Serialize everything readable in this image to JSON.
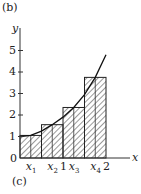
{
  "labels": {
    "top": "(b)",
    "bottom": "(c)",
    "xaxis": "x",
    "yaxis": "y",
    "origin": "0"
  },
  "chart_data": {
    "type": "bar",
    "title": "",
    "xlabel": "x",
    "ylabel": "y",
    "categories": [
      "x1",
      "x2",
      "x3",
      "x4"
    ],
    "intervals": [
      [
        0,
        0.5
      ],
      [
        0.5,
        1
      ],
      [
        1,
        1.5
      ],
      [
        1.5,
        2
      ]
    ],
    "values": [
      1.05,
      1.55,
      2.35,
      3.75
    ],
    "curve": {
      "x": [
        0,
        0.25,
        0.5,
        0.75,
        1,
        1.25,
        1.5,
        1.75,
        2
      ],
      "y": [
        1,
        1.05,
        1.25,
        1.55,
        1.9,
        2.35,
        2.95,
        3.75,
        4.8
      ]
    },
    "yticks": [
      "1",
      "2",
      "3",
      "4",
      "5"
    ],
    "xticks": [
      "x1",
      "x2",
      "1",
      "x3",
      "x4",
      "2"
    ],
    "xlim": [
      0,
      2.5
    ],
    "ylim": [
      0,
      5.8
    ],
    "grid": false,
    "fill": "hatched"
  }
}
